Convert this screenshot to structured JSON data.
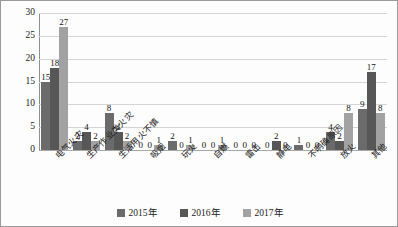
{
  "chart_data": {
    "type": "bar",
    "title": "",
    "subtitle": "",
    "xlabel": "",
    "ylabel": "受伤人数/人",
    "ylim": [
      0,
      30
    ],
    "yticks": [
      0,
      5,
      10,
      15,
      20,
      25,
      30
    ],
    "grid": true,
    "legend_position": "bottom",
    "categories": [
      "电气火灾",
      "生产作业类火灾",
      "生活用火不慎",
      "吸烟",
      "玩火",
      "自燃",
      "雷击",
      "静电",
      "不明确原因",
      "放火",
      "其他"
    ],
    "series": [
      {
        "name": "2015年",
        "color": "#6b6b6b",
        "values": [
          15,
          2,
          8,
          0,
          2,
          0,
          0,
          0,
          1,
          4,
          9
        ]
      },
      {
        "name": "2016年",
        "color": "#575757",
        "values": [
          18,
          4,
          4,
          0,
          0,
          0,
          0,
          2,
          0,
          2,
          17
        ]
      },
      {
        "name": "2017年",
        "color": "#a2a2a2",
        "values": [
          27,
          2,
          2,
          1,
          1,
          1,
          0,
          0,
          0,
          8,
          8
        ]
      }
    ]
  }
}
